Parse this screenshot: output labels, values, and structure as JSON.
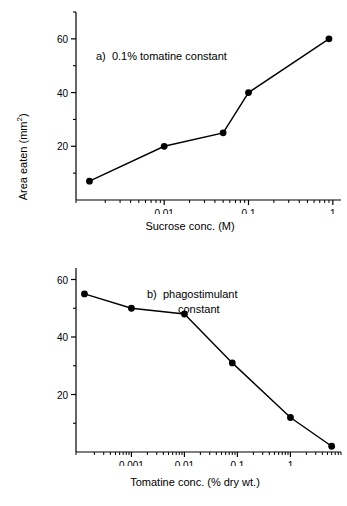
{
  "figure": {
    "y_axis_label_text": "Area eaten (mm",
    "y_axis_label_sup": "2",
    "y_axis_label_tail": ")"
  },
  "chart_data": [
    {
      "type": "line",
      "panel": "a",
      "title": "a)  0.1% tomatine constant",
      "xlabel": "Sucrose conc. (M)",
      "ylabel": "Area eaten (mm2)",
      "xscale": "log",
      "xticklabels": [
        "0.01",
        "0.1",
        "1"
      ],
      "xtickvalues": [
        0.01,
        0.1,
        1
      ],
      "yticklabels": [
        "20",
        "40",
        "60"
      ],
      "ytickvalues": [
        20,
        40,
        60
      ],
      "ylim": [
        0,
        70
      ],
      "grid": false,
      "legend": "none",
      "series": [
        {
          "name": "0.1% tomatine constant",
          "x": [
            0.0013,
            0.01,
            0.05,
            0.1,
            0.9
          ],
          "y": [
            7,
            20,
            25,
            40,
            60
          ],
          "marker": "filled-circle",
          "color": "#000000"
        }
      ]
    },
    {
      "type": "line",
      "panel": "b",
      "title": "b)  phagostimulant",
      "title_line2": "constant",
      "xlabel": "Tomatine conc. (% dry wt.)",
      "ylabel": "Area eaten (mm2)",
      "xscale": "log",
      "xticklabels": [
        "0.001",
        "0.01",
        "0.1",
        "1"
      ],
      "xtickvalues": [
        0.001,
        0.01,
        0.1,
        1
      ],
      "yticklabels": [
        "20",
        "40",
        "60"
      ],
      "ytickvalues": [
        20,
        40,
        60
      ],
      "ylim": [
        0,
        65
      ],
      "grid": false,
      "legend": "none",
      "series": [
        {
          "name": "phagostimulant constant",
          "x": [
            0.00013,
            0.001,
            0.01,
            0.08,
            1,
            6
          ],
          "y": [
            55,
            50,
            48,
            31,
            12,
            2
          ],
          "marker": "filled-circle",
          "color": "#000000"
        }
      ]
    }
  ]
}
